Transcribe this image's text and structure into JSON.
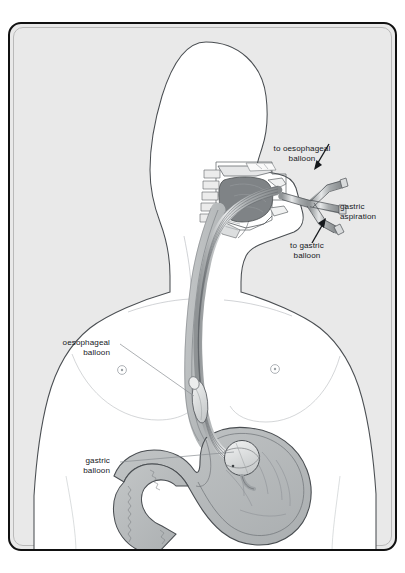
{
  "figure": {
    "kind": "medical-illustration",
    "frame": {
      "border_color": "#111111",
      "background_color": "#e9e9e9",
      "body_fill": "#ffffff",
      "tissue_fill": "#b9bcbd",
      "tongue_fill": "#808486",
      "outline_color": "#3a3e42"
    }
  },
  "labels": [
    {
      "id": "to-oesophageal-balloon",
      "text": "to oesophageal\nballoon",
      "align": "center",
      "x": 292,
      "y": 125,
      "leader": "arrow",
      "points_to": "upper inflation limb of the tube connector"
    },
    {
      "id": "gastric-aspiration",
      "text": "gastric\naspiration",
      "align": "left",
      "x": 362,
      "y": 183,
      "leader": "none",
      "points_to": "central aspiration limb of the tube connector"
    },
    {
      "id": "to-gastric-balloon",
      "text": "to gastric\nballoon",
      "align": "center",
      "x": 297,
      "y": 222,
      "leader": "arrow",
      "points_to": "lower inflation limb of the tube connector"
    },
    {
      "id": "oesophageal-balloon",
      "text": "oesophageal\nballoon",
      "align": "right",
      "x": 50,
      "y": 319,
      "leader": "line",
      "points_to": "elongated balloon on the tube within the oesophagus"
    },
    {
      "id": "gastric-balloon",
      "text": "gastric\nballoon",
      "align": "right",
      "x": 78,
      "y": 447,
      "leader": "line",
      "points_to": "round balloon at the tube tip inside the stomach fundus"
    }
  ],
  "anatomy": [
    {
      "id": "head-profile",
      "name": "head in right-facing profile"
    },
    {
      "id": "neck",
      "name": "neck"
    },
    {
      "id": "shoulders",
      "name": "shoulders and upper arms"
    },
    {
      "id": "chest",
      "name": "chest with nipples"
    },
    {
      "id": "abdomen",
      "name": "abdomen and waist"
    },
    {
      "id": "oral-cavity",
      "name": "oral cavity and tongue"
    },
    {
      "id": "nasopharynx",
      "name": "nasal cavity and nasopharynx"
    },
    {
      "id": "oesophagus",
      "name": "oesophagus"
    },
    {
      "id": "stomach",
      "name": "stomach with rugae"
    },
    {
      "id": "duodenum",
      "name": "duodenum"
    }
  ],
  "device": [
    {
      "id": "tube-shaft",
      "name": "multi-lumen tube shaft"
    },
    {
      "id": "tube-connector",
      "name": "three-limb external connector"
    },
    {
      "id": "oesophageal-balloon-part",
      "name": "oesophageal balloon"
    },
    {
      "id": "gastric-balloon-part",
      "name": "gastric balloon"
    }
  ]
}
